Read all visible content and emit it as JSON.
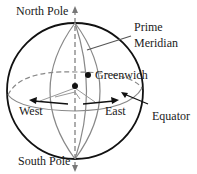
{
  "diagram": {
    "labels": {
      "north_pole": "North Pole",
      "south_pole": "South Pole",
      "prime_meridian_line1": "Prime",
      "prime_meridian_line2": "Meridian",
      "greenwich": "Greenwich",
      "west": "West",
      "east": "East",
      "equator": "Equator"
    },
    "colors": {
      "outline": "#111111",
      "meridian": "#8a8a8a",
      "axis": "#777777"
    }
  }
}
